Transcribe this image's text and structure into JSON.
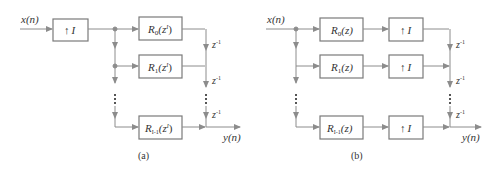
{
  "colors": {
    "line": "#8c8c8c",
    "box": "#7a7a7a",
    "text": "#333333",
    "background": "#ffffff"
  },
  "diagram_a": {
    "caption": "(a)",
    "input_label": "x(n)",
    "output_label": "y(n)",
    "upsampler": {
      "arrow": "↑",
      "factor": "I"
    },
    "branches": [
      {
        "name": "R",
        "sub": "0",
        "arg": "(z",
        "sup": "I",
        "close": ")"
      },
      {
        "name": "R",
        "sub": "1",
        "arg": "(z",
        "sup": "I",
        "close": ")"
      },
      {
        "name": "R",
        "sub": "I-1",
        "arg": "(z",
        "sup": "I",
        "close": ")"
      }
    ],
    "delays": [
      {
        "base": "z",
        "exp": "-1"
      },
      {
        "base": "z",
        "exp": "-1"
      },
      {
        "base": "z",
        "exp": "-1"
      }
    ],
    "ellipsis": "⋮"
  },
  "diagram_b": {
    "caption": "(b)",
    "input_label": "x(n)",
    "output_label": "y(n)",
    "branches": [
      {
        "filter": {
          "name": "R",
          "sub": "0",
          "arg": "(z)"
        },
        "upsampler": {
          "arrow": "↑",
          "factor": "I"
        }
      },
      {
        "filter": {
          "name": "R",
          "sub": "1",
          "arg": "(z)"
        },
        "upsampler": {
          "arrow": "↑",
          "factor": "I"
        }
      },
      {
        "filter": {
          "name": "R",
          "sub": "I-1",
          "arg": "(z)"
        },
        "upsampler": {
          "arrow": "↑",
          "factor": "I"
        }
      }
    ],
    "delays": [
      {
        "base": "z",
        "exp": "-1"
      },
      {
        "base": "z",
        "exp": "-1"
      },
      {
        "base": "z",
        "exp": "-1"
      }
    ],
    "ellipsis": "⋮"
  }
}
